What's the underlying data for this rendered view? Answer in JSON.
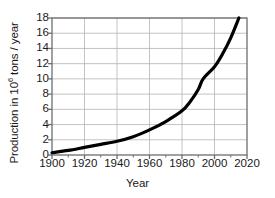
{
  "chart_data": {
    "type": "line",
    "title": "",
    "xlabel": "Year",
    "ylabel": "Production in 10^6 tons / year",
    "ylabel_base": "Production in 10",
    "ylabel_exp": "6",
    "ylabel_tail": " tons / year",
    "xlim": [
      1900,
      2020
    ],
    "ylim": [
      0,
      18
    ],
    "xticks": [
      1900,
      1920,
      1940,
      1960,
      1980,
      2000,
      2020
    ],
    "xtick_labels": [
      "1900",
      "1920",
      "1940",
      "1960",
      "1980",
      "2000",
      "2020"
    ],
    "yticks": [
      0,
      2,
      4,
      6,
      8,
      10,
      12,
      14,
      16,
      18
    ],
    "ytick_labels": [
      "0",
      "2",
      "4",
      "6",
      "8",
      "10",
      "12",
      "14",
      "16",
      "18"
    ],
    "grid": true,
    "legend": false,
    "line_color": "#000000",
    "grid_color": "#b4b4b4",
    "axis_color": "#6e6e6e",
    "background": "#ffffff",
    "x": [
      1900,
      1910,
      1920,
      1930,
      1940,
      1950,
      1960,
      1970,
      1980,
      1985,
      1990,
      1993,
      2000,
      2005,
      2010,
      2015
    ],
    "values": [
      0.3,
      0.6,
      1.0,
      1.4,
      1.8,
      2.4,
      3.3,
      4.4,
      5.8,
      7.0,
      8.6,
      10.0,
      11.6,
      13.3,
      15.4,
      18.0
    ]
  }
}
